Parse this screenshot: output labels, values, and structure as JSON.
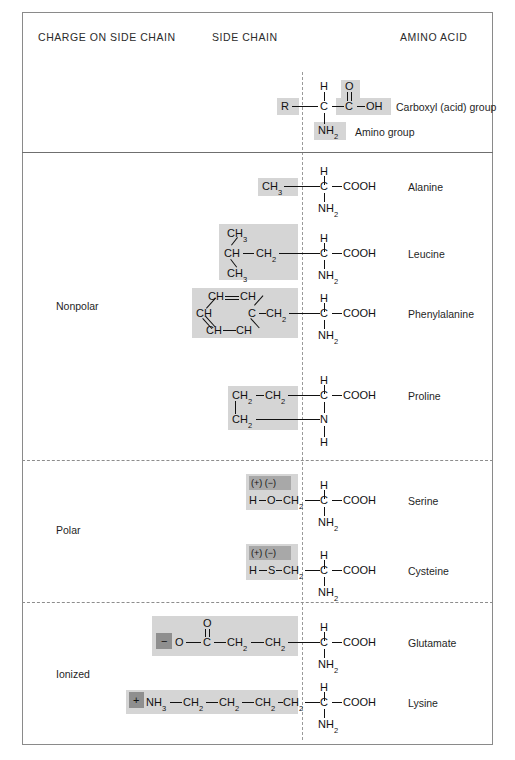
{
  "headers": {
    "charge": "CHARGE ON SIDE CHAIN",
    "side_chain": "SIDE CHAIN",
    "amino_acid": "AMINO ACID"
  },
  "generic": {
    "r": "R",
    "h": "H",
    "c_alpha": "C",
    "o": "O",
    "c_carboxyl": "C",
    "oh": "OH",
    "nh2": "NH",
    "nh2_sub": "2",
    "carboxyl_note": "Carboxyl (acid) group",
    "amino_note": "Amino group"
  },
  "groups": [
    {
      "label": "Nonpolar"
    },
    {
      "label": "Polar"
    },
    {
      "label": "Ionized"
    }
  ],
  "amino_acids": [
    {
      "name": "Alanine",
      "group": "Nonpolar",
      "backbone_h": "H",
      "backbone_c": "C",
      "backbone_cooh": "COOH",
      "backbone_n": "NH",
      "backbone_n_sub": "2"
    },
    {
      "name": "Leucine",
      "group": "Nonpolar",
      "backbone_h": "H",
      "backbone_c": "C",
      "backbone_cooh": "COOH",
      "backbone_n": "NH",
      "backbone_n_sub": "2"
    },
    {
      "name": "Phenylalanine",
      "group": "Nonpolar",
      "backbone_h": "H",
      "backbone_c": "C",
      "backbone_cooh": "COOH",
      "backbone_n": "NH",
      "backbone_n_sub": "2"
    },
    {
      "name": "Proline",
      "group": "Nonpolar",
      "backbone_h": "H",
      "backbone_c": "C",
      "backbone_cooh": "COOH",
      "backbone_n": "N",
      "backbone_n_sub": "",
      "backbone_n_h": "H"
    },
    {
      "name": "Serine",
      "group": "Polar",
      "backbone_h": "H",
      "backbone_c": "C",
      "backbone_cooh": "COOH",
      "backbone_n": "NH",
      "backbone_n_sub": "2"
    },
    {
      "name": "Cysteine",
      "group": "Polar",
      "backbone_h": "H",
      "backbone_c": "C",
      "backbone_cooh": "COOH",
      "backbone_n": "NH",
      "backbone_n_sub": "2"
    },
    {
      "name": "Glutamate",
      "group": "Ionized",
      "backbone_h": "H",
      "backbone_c": "C",
      "backbone_cooh": "COOH",
      "backbone_n": "NH",
      "backbone_n_sub": "2"
    },
    {
      "name": "Lysine",
      "group": "Ionized",
      "backbone_h": "H",
      "backbone_c": "C",
      "backbone_cooh": "COOH",
      "backbone_n": "NH",
      "backbone_n_sub": "2"
    }
  ],
  "side_chains": {
    "alanine": {
      "ch3": "CH",
      "ch3_sub": "3"
    },
    "leucine": {
      "ch3_top": "CH",
      "ch3_top_sub": "3",
      "ch": "CH",
      "ch3_bot": "CH",
      "ch3_bot_sub": "3",
      "ch2": "CH",
      "ch2_sub": "2"
    },
    "phenylalanine": {
      "ring_top_left": "CH",
      "ring_top_right": "CH",
      "ring_left": "CH",
      "ring_right": "C",
      "ring_bot_left": "CH",
      "ring_bot_right": "CH",
      "ch2": "CH",
      "ch2_sub": "2"
    },
    "proline": {
      "ch2_a": "CH",
      "ch2_a_sub": "2",
      "ch2_b": "CH",
      "ch2_b_sub": "2",
      "ch2_c": "CH",
      "ch2_c_sub": "2"
    },
    "serine": {
      "charge_badge": "(+) (−)",
      "h": "H",
      "o": "O",
      "ch2": "CH",
      "ch2_sub": "2"
    },
    "cysteine": {
      "charge_badge": "(+) (−)",
      "h": "H",
      "s": "S",
      "ch2": "CH",
      "ch2_sub": "2"
    },
    "glutamate": {
      "minus": "−",
      "o_single": "O",
      "o_double": "O",
      "c": "C",
      "ch2_a": "CH",
      "ch2_a_sub": "2",
      "ch2_b": "CH",
      "ch2_b_sub": "2"
    },
    "lysine": {
      "plus": "+",
      "nh3": "NH",
      "nh3_sub": "3",
      "ch2_a": "CH",
      "ch2_a_sub": "2",
      "ch2_b": "CH",
      "ch2_b_sub": "2",
      "ch2_c": "CH",
      "ch2_c_sub": "2",
      "ch2_d": "CH",
      "ch2_d_sub": "2"
    }
  },
  "colors": {
    "highlight": "#d5d5d5",
    "badge": "#a8a8a8",
    "dark_badge": "#8f8f8f",
    "border": "#8a8a8a",
    "text": "#1a1a1a"
  }
}
